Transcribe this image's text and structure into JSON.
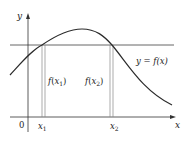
{
  "diagram": {
    "axis_labels": {
      "x": "x",
      "y": "y",
      "origin": "0"
    },
    "curve_label": "y = f(x)",
    "point_labels": [
      "x1",
      "x2"
    ],
    "segment_labels": [
      "f(x1)",
      "f(x2)"
    ],
    "colors": {
      "curve": "#2a2a2a",
      "axes": "#333333",
      "horizontal_line": "#444444",
      "segments": "#777777"
    }
  }
}
